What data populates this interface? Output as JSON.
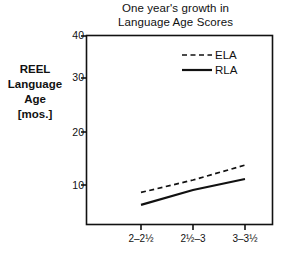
{
  "chart_data": {
    "type": "line",
    "title": "One year's growth in Language Age Scores",
    "title_line1": "One year's growth in",
    "title_line2": "Language Age Scores",
    "ylabel": "REEL Language Age [mos.]",
    "ylabel_line1": "REEL",
    "ylabel_line2": "Language",
    "ylabel_line3": "Age",
    "ylabel_line4": "[mos.]",
    "xlabel": "",
    "categories": [
      "2–2½",
      "2½–3",
      "3–3½"
    ],
    "yticks": [
      10,
      20,
      30,
      40
    ],
    "ytick_labels": [
      "10",
      "20",
      "30",
      "40"
    ],
    "ylim": [
      0,
      40
    ],
    "grid": false,
    "legend_position": "top-right",
    "series": [
      {
        "name": "ELA",
        "style": "dashed",
        "color": "#111111",
        "values": [
          8.5,
          11.0,
          14.0
        ]
      },
      {
        "name": "RLA",
        "style": "solid",
        "color": "#111111",
        "values": [
          6.0,
          9.0,
          11.2
        ]
      }
    ]
  },
  "axis": {
    "tick_40": "40",
    "tick_30": "30",
    "tick_20": "20",
    "tick_10": "10",
    "x_cat_0": "2–2½",
    "x_cat_1": "2½–3",
    "x_cat_2": "3–3½"
  },
  "legend": {
    "ela": "ELA",
    "rla": "RLA"
  }
}
